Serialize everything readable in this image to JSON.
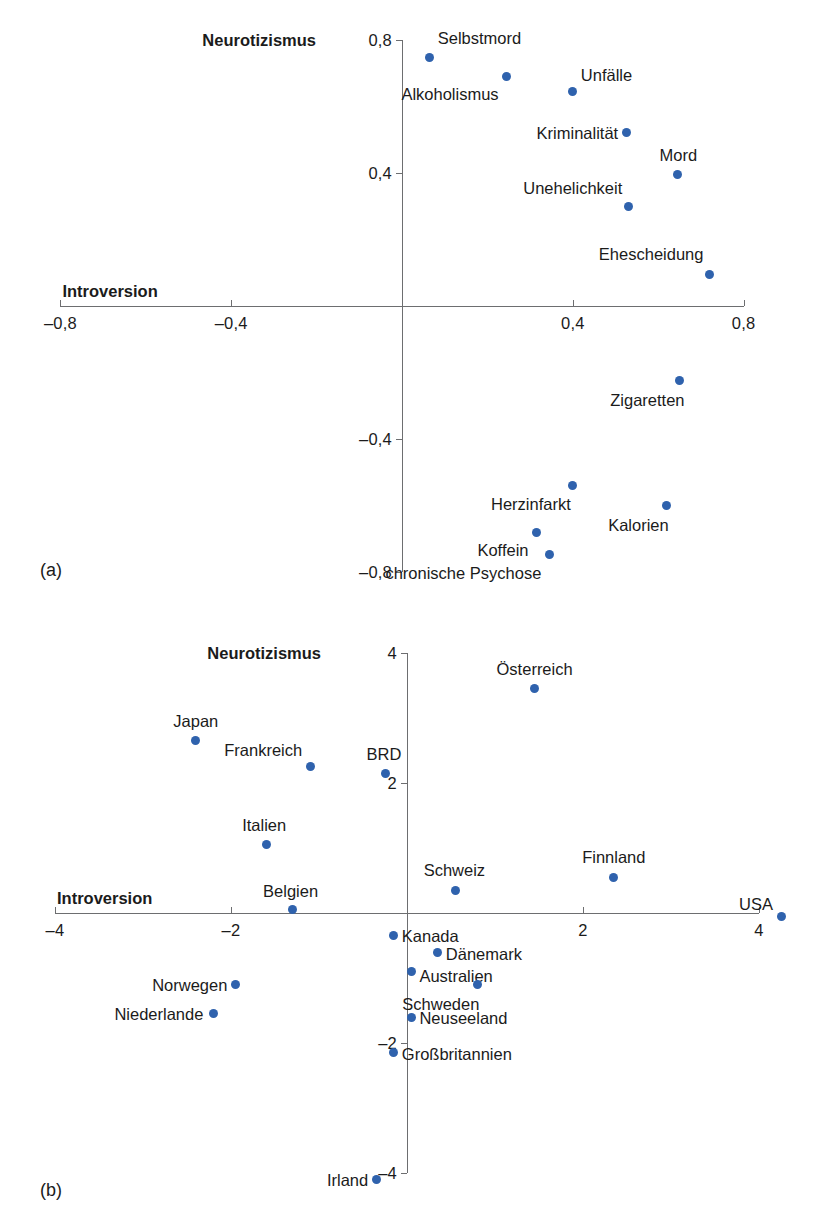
{
  "figure": {
    "panels": [
      {
        "tag": "(a)",
        "tag_x": 40,
        "tag_y": 560,
        "axes": {
          "origin_x": 402,
          "origin_y": 306,
          "x_px_per_unit": 427,
          "y_px_per_unit": 333,
          "x_min": -0.8,
          "x_max": 0.8,
          "y_min": -0.8,
          "y_max": 0.8,
          "x_title": "Introversion",
          "y_title": "Neurotizismus",
          "x_ticks": [
            {
              "value": -0.8,
              "label": "–0,8"
            },
            {
              "value": -0.4,
              "label": "–0,4"
            },
            {
              "value": 0.4,
              "label": "0,4"
            },
            {
              "value": 0.8,
              "label": "0,8"
            }
          ],
          "y_ticks": [
            {
              "value": 0.8,
              "label": "0,8"
            },
            {
              "value": 0.4,
              "label": "0,4"
            },
            {
              "value": -0.4,
              "label": "–0,4"
            },
            {
              "value": -0.8,
              "label": "–0,8"
            }
          ]
        },
        "points": [
          {
            "label": "Selbstmord",
            "x": 0.065,
            "y": 0.745,
            "lx": 8,
            "ly": -20,
            "anchor": "left"
          },
          {
            "label": "Alkoholismus",
            "x": 0.245,
            "y": 0.69,
            "lx": -8,
            "ly": 18,
            "anchor": "right"
          },
          {
            "label": "Unfälle",
            "x": 0.4,
            "y": 0.645,
            "lx": 8,
            "ly": -16,
            "anchor": "left"
          },
          {
            "label": "Kriminalität",
            "x": 0.525,
            "y": 0.52,
            "lx": -8,
            "ly": 0,
            "anchor": "right"
          },
          {
            "label": "Mord",
            "x": 0.645,
            "y": 0.395,
            "lx": 1,
            "ly": -19,
            "anchor": "center"
          },
          {
            "label": "Unehelichkeit",
            "x": 0.53,
            "y": 0.3,
            "lx": -6,
            "ly": -18,
            "anchor": "right"
          },
          {
            "label": "Ehescheidung",
            "x": 0.72,
            "y": 0.095,
            "lx": -6,
            "ly": -20,
            "anchor": "right"
          },
          {
            "label": "Zigaretten",
            "x": 0.65,
            "y": -0.225,
            "lx": 5,
            "ly": 19,
            "anchor": "right"
          },
          {
            "label": "Herzinfarkt",
            "x": 0.4,
            "y": -0.54,
            "lx": -2,
            "ly": 18,
            "anchor": "right"
          },
          {
            "label": "Kalorien",
            "x": 0.62,
            "y": -0.6,
            "lx": 2,
            "ly": 19,
            "anchor": "right"
          },
          {
            "label": "Koffein",
            "x": 0.315,
            "y": -0.68,
            "lx": -8,
            "ly": 18,
            "anchor": "right"
          },
          {
            "label": "chronische Psychose",
            "x": 0.345,
            "y": -0.745,
            "lx": -8,
            "ly": 19,
            "anchor": "right"
          }
        ]
      },
      {
        "tag": "(b)",
        "tag_x": 40,
        "tag_y": 1180,
        "axes": {
          "origin_x": 407,
          "origin_y": 913,
          "x_px_per_unit": 88,
          "y_px_per_unit": 65,
          "x_min": -4,
          "x_max": 4,
          "y_min": -4,
          "y_max": 4,
          "x_title": "Introversion",
          "y_title": "Neurotizismus",
          "x_ticks": [
            {
              "value": -4,
              "label": "–4"
            },
            {
              "value": -2,
              "label": "–2"
            },
            {
              "value": 2,
              "label": "2"
            },
            {
              "value": 4,
              "label": "4"
            }
          ],
          "y_ticks": [
            {
              "value": 4,
              "label": "4"
            },
            {
              "value": 2,
              "label": "2"
            },
            {
              "value": -2,
              "label": "–2"
            },
            {
              "value": -4,
              "label": "–4"
            }
          ]
        },
        "points": [
          {
            "label": "Österreich",
            "x": 1.45,
            "y": 3.45,
            "lx": 0,
            "ly": -20,
            "anchor": "center"
          },
          {
            "label": "Japan",
            "x": -2.4,
            "y": 2.65,
            "lx": 0,
            "ly": -20,
            "anchor": "center"
          },
          {
            "label": "Frankreich",
            "x": -1.1,
            "y": 2.25,
            "lx": -8,
            "ly": -17,
            "anchor": "right"
          },
          {
            "label": "BRD",
            "x": -0.25,
            "y": 2.15,
            "lx": -1,
            "ly": -19,
            "anchor": "center"
          },
          {
            "label": "Italien",
            "x": -1.6,
            "y": 1.05,
            "lx": -2,
            "ly": -20,
            "anchor": "center"
          },
          {
            "label": "Finnland",
            "x": 2.35,
            "y": 0.55,
            "lx": 0,
            "ly": -20,
            "anchor": "center"
          },
          {
            "label": "Schweiz",
            "x": 0.55,
            "y": 0.35,
            "lx": -1,
            "ly": -20,
            "anchor": "center"
          },
          {
            "label": "Belgien",
            "x": -1.3,
            "y": 0.05,
            "lx": -2,
            "ly": -19,
            "anchor": "center"
          },
          {
            "label": "USA",
            "x": 4.25,
            "y": -0.05,
            "lx": -8,
            "ly": -12,
            "anchor": "right"
          },
          {
            "label": "Kanada",
            "x": -0.15,
            "y": -0.35,
            "lx": 8,
            "ly": 0,
            "anchor": "left"
          },
          {
            "label": "Dänemark",
            "x": 0.35,
            "y": -0.6,
            "lx": 8,
            "ly": 2,
            "anchor": "left"
          },
          {
            "label": "Australien",
            "x": 0.05,
            "y": -0.9,
            "lx": 8,
            "ly": 4,
            "anchor": "left"
          },
          {
            "label": "Schweden",
            "x": 0.8,
            "y": -1.1,
            "lx": 2,
            "ly": 19,
            "anchor": "right"
          },
          {
            "label": "Neuseeland",
            "x": 0.05,
            "y": -1.6,
            "lx": 8,
            "ly": 1,
            "anchor": "left"
          },
          {
            "label": "Großbritannien",
            "x": -0.15,
            "y": -2.15,
            "lx": 8,
            "ly": 1,
            "anchor": "left"
          },
          {
            "label": "Norwegen",
            "x": -1.95,
            "y": -1.1,
            "lx": -8,
            "ly": 0,
            "anchor": "right"
          },
          {
            "label": "Niederlande",
            "x": -2.2,
            "y": -1.55,
            "lx": -10,
            "ly": 0,
            "anchor": "right"
          },
          {
            "label": "Irland",
            "x": -0.35,
            "y": -4.1,
            "lx": -8,
            "ly": 0,
            "anchor": "right"
          }
        ]
      }
    ]
  },
  "chart_data": {
    "type": "scatter",
    "title": "",
    "xlabel": "Introversion",
    "ylabel": "Neurotizismus",
    "legend": "none",
    "grid": false,
    "panels": [
      {
        "panel": "(a)",
        "xlabel": "Introversion",
        "ylabel": "Neurotizismus",
        "xlim": [
          -0.8,
          0.8
        ],
        "ylim": [
          -0.8,
          0.8
        ],
        "xticks": [
          -0.8,
          -0.4,
          0.4,
          0.8
        ],
        "yticks": [
          -0.8,
          -0.4,
          0.4,
          0.8
        ],
        "xtick_labels": [
          "–0,8",
          "–0,4",
          "0,4",
          "0,8"
        ],
        "ytick_labels": [
          "–0,8",
          "–0,4",
          "0,4",
          "0,8"
        ],
        "labels": [
          "Selbstmord",
          "Alkoholismus",
          "Unfälle",
          "Kriminalität",
          "Mord",
          "Unehelichkeit",
          "Ehescheidung",
          "Zigaretten",
          "Herzinfarkt",
          "Kalorien",
          "Koffein",
          "chronische Psychose"
        ],
        "x": [
          0.065,
          0.245,
          0.4,
          0.525,
          0.645,
          0.53,
          0.72,
          0.65,
          0.4,
          0.62,
          0.315,
          0.345
        ],
        "y": [
          0.745,
          0.69,
          0.645,
          0.52,
          0.395,
          0.3,
          0.095,
          -0.225,
          -0.54,
          -0.6,
          -0.68,
          -0.745
        ]
      },
      {
        "panel": "(b)",
        "xlabel": "Introversion",
        "ylabel": "Neurotizismus",
        "xlim": [
          -4,
          4
        ],
        "ylim": [
          -4,
          4
        ],
        "xticks": [
          -4,
          -2,
          2,
          4
        ],
        "yticks": [
          -4,
          -2,
          2,
          4
        ],
        "xtick_labels": [
          "–4",
          "–2",
          "2",
          "4"
        ],
        "ytick_labels": [
          "–4",
          "–2",
          "2",
          "4"
        ],
        "labels": [
          "Österreich",
          "Japan",
          "Frankreich",
          "BRD",
          "Italien",
          "Finnland",
          "Schweiz",
          "Belgien",
          "USA",
          "Kanada",
          "Dänemark",
          "Australien",
          "Schweden",
          "Neuseeland",
          "Großbritannien",
          "Norwegen",
          "Niederlande",
          "Irland"
        ],
        "x": [
          1.45,
          -2.4,
          -1.1,
          -0.25,
          -1.6,
          2.35,
          0.55,
          -1.3,
          4.25,
          -0.15,
          0.35,
          0.05,
          0.8,
          0.05,
          -0.15,
          -1.95,
          -2.2,
          -0.35
        ],
        "y": [
          3.45,
          2.65,
          2.25,
          2.15,
          1.05,
          0.55,
          0.35,
          0.05,
          -0.05,
          -0.35,
          -0.6,
          -0.9,
          -1.1,
          -1.6,
          -2.15,
          -1.1,
          -1.55,
          -4.1
        ]
      }
    ],
    "colors": {
      "marker": "#2f62ad",
      "axis": "#6d6e70",
      "text": "#1b1b1b"
    }
  }
}
